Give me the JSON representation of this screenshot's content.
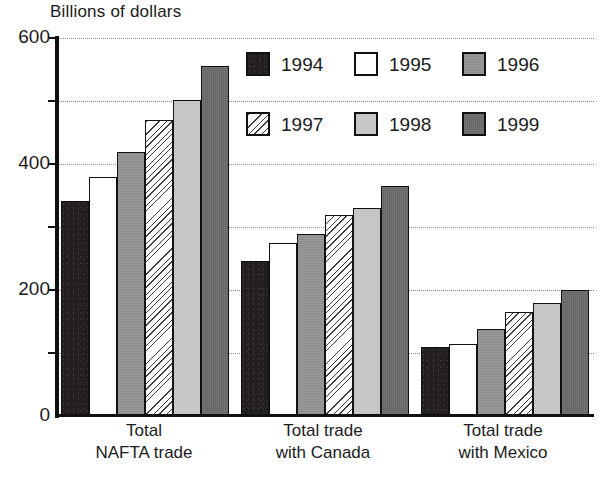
{
  "chart_data": {
    "type": "bar",
    "title": "Billions of dollars",
    "xlabel": "",
    "ylabel": "Billions of dollars",
    "ylim": [
      0,
      600
    ],
    "ytick_labels": [
      "0",
      "200",
      "400",
      "600"
    ],
    "yticks": [
      0,
      200,
      400,
      600
    ],
    "minor_gridlines": [
      100,
      300,
      500
    ],
    "grid": true,
    "legend_position": "upper-center",
    "categories": [
      "Total NAFTA trade",
      "Total trade with Canada",
      "Total trade with Mexico"
    ],
    "category_lines": [
      [
        "Total",
        "NAFTA trade"
      ],
      [
        "Total trade",
        "with Canada"
      ],
      [
        "Total trade",
        "with Mexico"
      ]
    ],
    "series": [
      {
        "name": "1994",
        "fill": "solid-black",
        "color": "#231f20",
        "values": [
          341,
          246,
          110
        ]
      },
      {
        "name": "1995",
        "fill": "white",
        "color": "#ffffff",
        "values": [
          379,
          275,
          114
        ]
      },
      {
        "name": "1996",
        "fill": "medium-gray",
        "color": "#8e8e8e",
        "values": [
          419,
          289,
          138
        ]
      },
      {
        "name": "1997",
        "fill": "white-diagonal-hatch",
        "color": "#ffffff",
        "values": [
          470,
          319,
          165
        ]
      },
      {
        "name": "1998",
        "fill": "light-gray",
        "color": "#c2c2c2",
        "values": [
          502,
          330,
          179
        ]
      },
      {
        "name": "1999",
        "fill": "dark-gray",
        "color": "#6e6e6e",
        "values": [
          556,
          365,
          200
        ]
      }
    ]
  },
  "legend": {
    "entries": [
      {
        "label": "1994"
      },
      {
        "label": "1995"
      },
      {
        "label": "1996"
      },
      {
        "label": "1997"
      },
      {
        "label": "1998"
      },
      {
        "label": "1999"
      }
    ]
  },
  "axis": {
    "title": "Billions of dollars",
    "y_labels": [
      "600",
      "400",
      "200",
      "0"
    ]
  }
}
